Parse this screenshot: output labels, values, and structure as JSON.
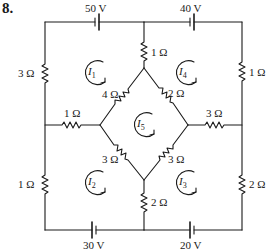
{
  "problem_number": "8.",
  "sources": [
    {
      "id": "top-left",
      "label": "50 V"
    },
    {
      "id": "top-right",
      "label": "40 V"
    },
    {
      "id": "bottom-left",
      "label": "30 V"
    },
    {
      "id": "bottom-right",
      "label": "20 V"
    }
  ],
  "resistors": [
    {
      "id": "left-upper",
      "label": "3 Ω"
    },
    {
      "id": "left-lower",
      "label": "1 Ω"
    },
    {
      "id": "right-upper",
      "label": "1 Ω"
    },
    {
      "id": "right-lower",
      "label": "2 Ω"
    },
    {
      "id": "center-top",
      "label": "1 Ω"
    },
    {
      "id": "center-bottom",
      "label": "2 Ω"
    },
    {
      "id": "mid-left",
      "label": "1 Ω"
    },
    {
      "id": "mid-right",
      "label": "3 Ω"
    },
    {
      "id": "diamond-upper-left",
      "label": "4 Ω"
    },
    {
      "id": "diamond-upper-right",
      "label": "2 Ω"
    },
    {
      "id": "diamond-lower-left",
      "label": "3 Ω"
    },
    {
      "id": "diamond-lower-right",
      "label": "3 Ω"
    }
  ],
  "mesh_currents": [
    {
      "id": "I1",
      "symbol": "I",
      "sub": "1",
      "direction": "clockwise"
    },
    {
      "id": "I2",
      "symbol": "I",
      "sub": "2",
      "direction": "clockwise"
    },
    {
      "id": "I3",
      "symbol": "I",
      "sub": "3",
      "direction": "clockwise"
    },
    {
      "id": "I4",
      "symbol": "I",
      "sub": "4",
      "direction": "clockwise"
    },
    {
      "id": "I5",
      "symbol": "I",
      "sub": "5",
      "direction": "clockwise"
    }
  ],
  "colors": {
    "ink": "#1a1a1a",
    "background": "#ffffff"
  }
}
